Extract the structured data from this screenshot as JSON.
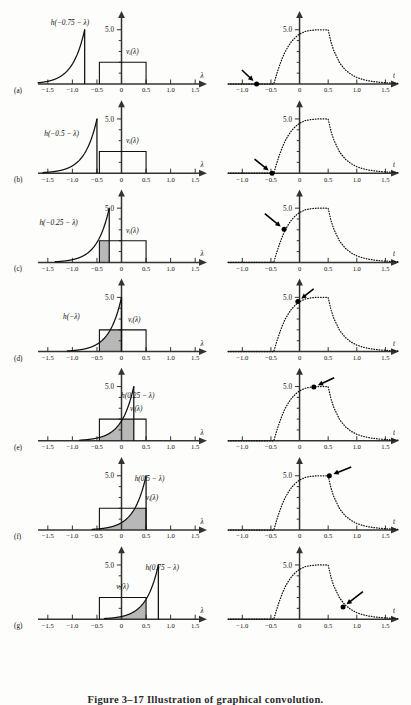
{
  "figure": {
    "caption": "Figure 3–17   Illustration of graphical convolution.",
    "width": 411,
    "height": 703,
    "row_count": 7
  },
  "style": {
    "curve_color": "#111111",
    "axis_color": "#333333",
    "shade_color": "#b8b8b8",
    "rect_color": "#111111",
    "dot_color": "#000000"
  },
  "left_axis": {
    "x_label": "λ",
    "y_label": "5.0",
    "x_ticks": [
      -1.5,
      -1.0,
      -0.5,
      0,
      0.5,
      1.0,
      1.5
    ],
    "x_tick_labels": [
      "−1.5",
      "−1.0",
      "−0.5",
      "0",
      "0.5",
      "1.0",
      "1.5"
    ],
    "xlim": [
      -1.7,
      1.72
    ],
    "ylim": [
      0,
      5.9
    ],
    "y_major": 5.0,
    "y_minor_count": 5
  },
  "right_axis": {
    "x_label": "t",
    "y_label": "5.0",
    "x_ticks": [
      -1.0,
      -0.5,
      0,
      0.5,
      1.0,
      1.5
    ],
    "x_tick_labels": [
      "−1.0",
      "−0.5",
      "0",
      "0.5",
      "1.0",
      "1.5"
    ],
    "xlim": [
      -1.25,
      1.72
    ],
    "ylim": [
      0,
      5.9
    ],
    "y_major": 5.0,
    "y_minor_count": 5
  },
  "signals": {
    "rect_label": "vᵢ(λ)",
    "rect_start": -0.45,
    "rect_end": 0.5,
    "rect_height": 2.0,
    "h_peak": 5.0,
    "h_decay_rate": 4.0,
    "h_support": 1.1
  },
  "chart_data": {
    "type": "line",
    "title": "Illustration of graphical convolution",
    "xlabel": "t",
    "ylabel": "",
    "xlim": [
      -1.25,
      1.72
    ],
    "ylim": [
      0,
      5.9
    ],
    "grid": false,
    "legend": "none",
    "x": [
      -1.25,
      -1.0,
      -0.75,
      -0.5,
      -0.45,
      -0.4,
      -0.35,
      -0.3,
      -0.25,
      -0.2,
      -0.15,
      -0.1,
      -0.05,
      0.0,
      0.1,
      0.2,
      0.3,
      0.4,
      0.5,
      0.55,
      0.6,
      0.7,
      0.8,
      0.9,
      1.0,
      1.1,
      1.2,
      1.3,
      1.4,
      1.5,
      1.6,
      1.72
    ],
    "y": [
      0,
      0,
      0,
      0,
      0,
      0.9,
      1.7,
      2.4,
      3.0,
      3.45,
      3.85,
      4.15,
      4.4,
      4.6,
      4.85,
      4.95,
      5.0,
      5.0,
      5.0,
      3.85,
      3.05,
      1.95,
      1.3,
      0.88,
      0.6,
      0.42,
      0.3,
      0.22,
      0.16,
      0.12,
      0.09,
      0.06
    ]
  },
  "rows": [
    {
      "id": "a",
      "row_label": "(a)",
      "h_label": "h(−0.75 − λ)",
      "h_label_x": -1.05,
      "h_label_y": 5.4,
      "shift": -0.75,
      "rect_label_x": 0.22,
      "rect_label_y": 2.75,
      "shade_from": null,
      "shade_to": null,
      "marker_t": -0.75,
      "marker_y": 0.0,
      "arrow_from_t": -1.02,
      "arrow_from_y": 1.35
    },
    {
      "id": "b",
      "row_label": "(b)",
      "h_label": "h(−0.5 − λ)",
      "h_label_x": -1.22,
      "h_label_y": 3.45,
      "shift": -0.5,
      "rect_label_x": 0.22,
      "rect_label_y": 2.75,
      "shade_from": null,
      "shade_to": null,
      "marker_t": -0.48,
      "marker_y": 0.0,
      "arrow_from_t": -0.8,
      "arrow_from_y": 1.35
    },
    {
      "id": "c",
      "row_label": "(c)",
      "h_label": "h(−0.25 − λ)",
      "h_label_x": -1.28,
      "h_label_y": 3.45,
      "shift": -0.25,
      "rect_label_x": 0.22,
      "rect_label_y": 2.75,
      "shade_from": -0.45,
      "shade_to": -0.25,
      "marker_t": -0.27,
      "marker_y": 3.05,
      "arrow_from_t": -0.62,
      "arrow_from_y": 4.55
    },
    {
      "id": "d",
      "row_label": "(d)",
      "h_label": "h(−λ)",
      "h_label_x": -1.02,
      "h_label_y": 3.05,
      "shift": 0.0,
      "rect_label_x": 0.26,
      "rect_label_y": 2.75,
      "shade_from": -0.45,
      "shade_to": 0.0,
      "marker_t": -0.03,
      "marker_y": 4.62,
      "arrow_from_t": 0.26,
      "arrow_from_y": 5.85
    },
    {
      "id": "e",
      "row_label": "(e)",
      "h_label": "h(0.25 − λ)",
      "h_label_x": 0.33,
      "h_label_y": 3.95,
      "shift": 0.25,
      "rect_label_x": 0.3,
      "rect_label_y": 2.75,
      "shade_from": -0.45,
      "shade_to": 0.25,
      "marker_t": 0.25,
      "marker_y": 4.95,
      "arrow_from_t": 0.62,
      "arrow_from_y": 5.85
    },
    {
      "id": "f",
      "row_label": "(f)",
      "h_label": "h(0.5 − λ)",
      "h_label_x": 0.57,
      "h_label_y": 4.55,
      "shift": 0.5,
      "rect_label_x": 0.62,
      "rect_label_y": 2.75,
      "shade_from": -0.45,
      "shade_to": 0.5,
      "marker_t": 0.52,
      "marker_y": 5.0,
      "arrow_from_t": 0.92,
      "arrow_from_y": 5.85
    },
    {
      "id": "g",
      "row_label": "(g)",
      "h_label": "h(0.75 − λ)",
      "h_label_x": 0.83,
      "h_label_y": 4.55,
      "shift": 0.75,
      "rect_label_x": 0.02,
      "rect_label_y": 2.75,
      "shade_from": -0.45,
      "shade_to": 0.5,
      "marker_t": 0.76,
      "marker_y": 1.12,
      "arrow_from_t": 1.12,
      "arrow_from_y": 2.6
    }
  ]
}
